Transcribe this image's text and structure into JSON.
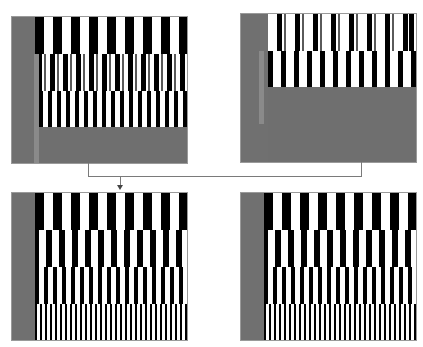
{
  "colors": {
    "background": "#ffffff",
    "panel_gray": "#6f6f6f",
    "side_gray": "#707070",
    "accent_strip": "#8a8a8a",
    "stripe_dark": "#000000",
    "stripe_light": "#ffffff",
    "stripe_mid": "#5a5a5a",
    "connector": "#7a7a7a"
  },
  "panels": [
    {
      "id": "top-left",
      "x": 11,
      "y": 16,
      "w": 177,
      "h": 148,
      "gray_col_w": 23,
      "accent_strip": {
        "x": 22,
        "y": 37,
        "w": 5,
        "h": 111
      },
      "rows": [
        {
          "x": 23,
          "y": 0,
          "w": 154,
          "h": 37,
          "period": 18,
          "dark": 9,
          "offset": 0,
          "mid": false
        },
        {
          "x": 27,
          "y": 37,
          "w": 150,
          "h": 37,
          "period": 13,
          "dark": 5,
          "offset": 2,
          "mid": true
        },
        {
          "x": 27,
          "y": 74,
          "w": 150,
          "h": 36,
          "period": 9,
          "dark": 4,
          "offset": 0,
          "mid": false
        }
      ]
    },
    {
      "id": "top-right",
      "x": 240,
      "y": 13,
      "w": 177,
      "h": 150,
      "gray_col_w": 27,
      "accent_strip": {
        "x": 18,
        "y": 37,
        "w": 5,
        "h": 73
      },
      "rows": [
        {
          "x": 27,
          "y": 0,
          "w": 150,
          "h": 37,
          "period": 18,
          "dark": 5,
          "offset": 9,
          "mid": true
        },
        {
          "x": 27,
          "y": 37,
          "w": 150,
          "h": 36,
          "period": 13,
          "dark": 5,
          "offset": 0,
          "mid": false
        }
      ]
    },
    {
      "id": "bottom-left",
      "x": 11,
      "y": 192,
      "w": 177,
      "h": 149,
      "gray_col_w": 23,
      "accent_strip": null,
      "rows": [
        {
          "x": 23,
          "y": 0,
          "w": 154,
          "h": 37,
          "period": 18,
          "dark": 9,
          "offset": 0,
          "mid": false
        },
        {
          "x": 23,
          "y": 37,
          "w": 154,
          "h": 37,
          "period": 13,
          "dark": 6,
          "offset": 2,
          "mid": false
        },
        {
          "x": 23,
          "y": 74,
          "w": 154,
          "h": 37,
          "period": 9,
          "dark": 4,
          "offset": 0,
          "mid": false
        },
        {
          "x": 23,
          "y": 111,
          "w": 154,
          "h": 38,
          "period": 5,
          "dark": 2,
          "offset": 0,
          "mid": false
        }
      ]
    },
    {
      "id": "bottom-right",
      "x": 240,
      "y": 192,
      "w": 177,
      "h": 149,
      "gray_col_w": 23,
      "accent_strip": null,
      "rows": [
        {
          "x": 23,
          "y": 0,
          "w": 154,
          "h": 37,
          "period": 18,
          "dark": 9,
          "offset": 0,
          "mid": false
        },
        {
          "x": 23,
          "y": 37,
          "w": 154,
          "h": 37,
          "period": 13,
          "dark": 6,
          "offset": 2,
          "mid": false
        },
        {
          "x": 23,
          "y": 74,
          "w": 154,
          "h": 37,
          "period": 9,
          "dark": 4,
          "offset": 0,
          "mid": false
        },
        {
          "x": 23,
          "y": 111,
          "w": 154,
          "h": 38,
          "period": 5,
          "dark": 2,
          "offset": 0,
          "mid": false
        }
      ]
    }
  ],
  "connectors": [
    {
      "id": "left-drop",
      "x": 88,
      "y": 163,
      "w": 1,
      "h": 14
    },
    {
      "id": "horizontal",
      "x": 88,
      "y": 176,
      "w": 274,
      "h": 1
    },
    {
      "id": "right-drop",
      "x": 361,
      "y": 162,
      "w": 1,
      "h": 15
    },
    {
      "id": "arrow-stem",
      "x": 120,
      "y": 176,
      "w": 1,
      "h": 10
    }
  ],
  "arrow_head": {
    "x": 117,
    "y": 185
  }
}
